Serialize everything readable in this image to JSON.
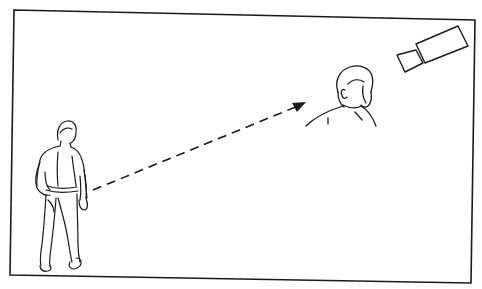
{
  "illustration": {
    "description": "Line drawing: a man standing at left with a dashed arrow pointing toward a second man, seen from behind, who is watched by a surveillance camera at top right",
    "colors": {
      "background": "#ffffff",
      "ink": "#1a1a1a"
    },
    "elements": {
      "frame": "border-frame",
      "observer": "standing-man-figure",
      "target": "man-head-shoulders",
      "camera": "surveillance-camera-icon",
      "arrow": "dashed-arrow"
    }
  }
}
